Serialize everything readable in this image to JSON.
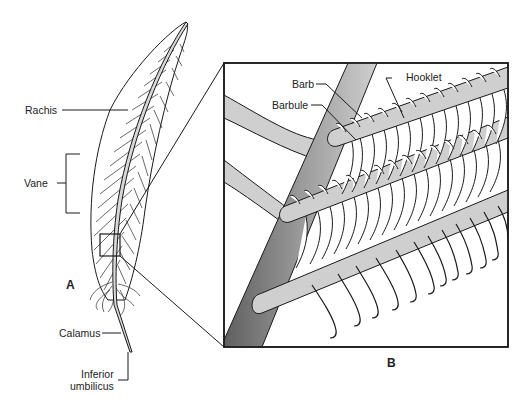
{
  "figure": {
    "panel_a_label": "A",
    "panel_b_label": "B",
    "feather_labels": {
      "rachis": "Rachis",
      "vane": "Vane",
      "calamus": "Calamus",
      "inferior_umbilicus_line1": "Inferior",
      "inferior_umbilicus_line2": "umbilicus"
    },
    "detail_labels": {
      "barb": "Barb",
      "barbule": "Barbule",
      "hooklet": "Hooklet"
    }
  },
  "colors": {
    "line": "#1a1a1a",
    "shaft_dark": "#6e6e6e",
    "shaft_light": "#c8c8c8",
    "barb_fill": "#cfcfcf",
    "background": "#ffffff"
  }
}
